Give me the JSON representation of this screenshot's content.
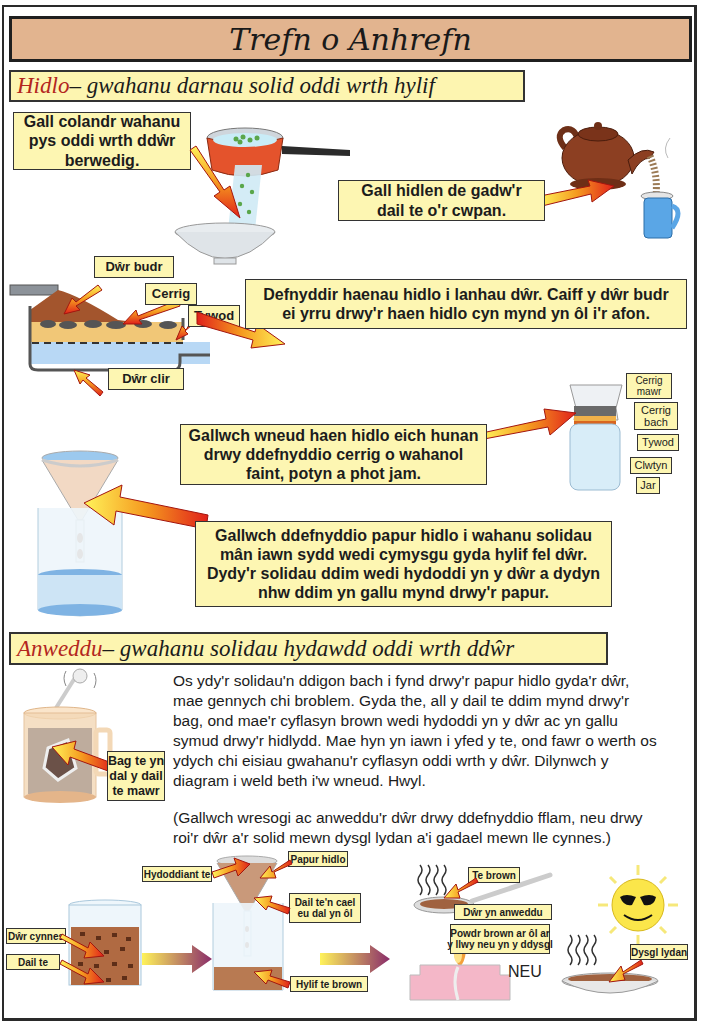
{
  "page": {
    "title": "Trefn o Anhrefn"
  },
  "hidlo": {
    "heading_keyword": "Hidlo",
    "heading_rest": " – gwahanu darnau solid oddi wrth hylif",
    "colander_callout": [
      "Gall colandr wahanu",
      "pys oddi wrth ddŵr",
      "berwedig."
    ],
    "tea_strainer_callout": [
      "Gall hidlen de gadw'r",
      "dail te o'r cwpan."
    ],
    "filter_bed": {
      "labels": {
        "dirty_water": "Dŵr budr",
        "stones": "Cerrig",
        "sand": "Tywod",
        "clean_water": "Dŵr clir"
      },
      "callout": [
        "Defnyddir haenau hidlo i lanhau dŵr. Caiff y dŵr budr",
        "ei yrru drwy'r haen hidlo cyn mynd yn ôl i'r afon."
      ]
    },
    "jar_filter": {
      "callout": [
        "Gallwch wneud haen hidlo eich hunan",
        "drwy ddefnyddio cerrig o wahanol",
        "faint, potyn a phot jam."
      ],
      "labels": {
        "big_stones": [
          "Cerrig",
          "mawr"
        ],
        "small_stones": [
          "Cerrig",
          "bach"
        ],
        "sand": "Tywod",
        "cloth": "Clwtyn",
        "jar": "Jar"
      }
    },
    "filter_paper_callout": [
      "Gallwch ddefnyddio papur hidlo i wahanu solidau",
      "mân iawn sydd wedi cymysgu gyda hylif fel dŵr.",
      "Dydy'r solidau ddim wedi hydoddi yn y dŵr a dydyn",
      "nhw ddim yn gallu mynd drwy'r papur."
    ]
  },
  "anweddu": {
    "heading_keyword": "Anweddu",
    "heading_rest": " – gwahanu solidau hydawdd oddi wrth ddŵr",
    "tea_bag_label": [
      "Bag te yn",
      "dal y dail",
      "te mawr"
    ],
    "paragraph_1": [
      "Os ydy'r solidau'n ddigon bach i fynd drwy'r papur hidlo gyda'r dŵr,",
      "mae gennych chi broblem. Gyda the, all y dail te ddim mynd drwy'r",
      "bag, ond mae'r cyflasyn brown wedi hydoddi yn y dŵr ac yn gallu",
      "symud drwy'r hidlydd. Mae hyn yn iawn i yfed y te, ond fawr o werth os",
      "ydych chi eisiau gwahanu'r cyflasyn oddi wrth y dŵr. Dilynwch y",
      "diagram i weld beth i'w wneud. Hwyl."
    ],
    "paragraph_2": [
      "(Gallwch wresogi ac anweddu'r dŵr drwy ddefnyddio fflam, neu drwy",
      "roi'r dŵr a'r solid mewn dysgl lydan a'i gadael mewn lle cynnes.)"
    ],
    "diagram": {
      "warm_water": "Dŵr cynnes",
      "tea_leaves": "Dail te",
      "tea_solution": "Hydoddiant te",
      "filter_paper": "Papur hidlo",
      "leaves_retained": [
        "Dail te'n cael",
        "eu dal yn ôl"
      ],
      "brown_liquid": "Hylif te brown",
      "brown_tea": "Te brown",
      "water_evaporating": "Dŵr yn anweddu",
      "brown_powder": [
        "Powdr brown ar ôl ar",
        "y llwy neu yn y ddysgl"
      ],
      "or": "NEU",
      "wide_dish": "Dysgl lydan"
    }
  },
  "colors": {
    "title_bg": "#e2b48f",
    "callout_bg": "#fdf6b2",
    "heading_keyword": "#b3261e",
    "border": "#2a2a2a"
  }
}
